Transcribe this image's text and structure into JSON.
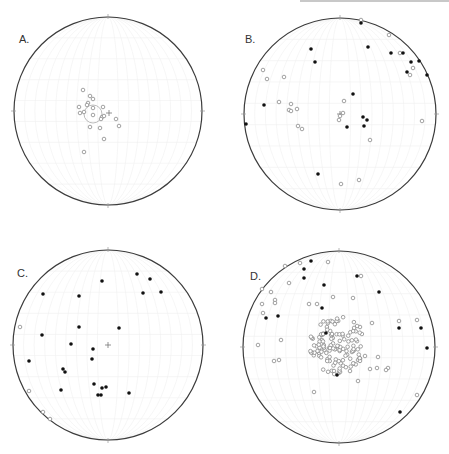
{
  "chart_data": [
    {
      "type": "scatter",
      "title": "A.",
      "subtype": "stereonet",
      "center": [
        108,
        111
      ],
      "radius": 94,
      "legend": [],
      "mean_marker": {
        "x": 93,
        "y": 114,
        "circle_radius": 9
      },
      "open_points": [
        [
          83,
          90
        ],
        [
          90,
          96
        ],
        [
          93,
          99
        ],
        [
          88,
          103
        ],
        [
          87,
          105
        ],
        [
          79,
          107
        ],
        [
          84,
          112
        ],
        [
          93,
          108
        ],
        [
          103,
          107
        ],
        [
          80,
          113
        ],
        [
          93,
          115
        ],
        [
          102,
          117
        ],
        [
          104,
          116
        ],
        [
          101,
          119
        ],
        [
          116,
          119
        ],
        [
          119,
          126
        ],
        [
          90,
          127
        ],
        [
          100,
          128
        ],
        [
          104,
          139
        ],
        [
          84,
          152
        ]
      ],
      "filled_points": [],
      "center_cross": [
        109,
        113
      ]
    },
    {
      "type": "scatter",
      "title": "B.",
      "subtype": "stereonet",
      "center": [
        340,
        114
      ],
      "radius": 96,
      "open_points": [
        [
          361,
          20
        ],
        [
          389,
          35
        ],
        [
          400,
          53
        ],
        [
          413,
          68
        ],
        [
          410,
          75
        ],
        [
          263,
          70
        ],
        [
          267,
          79
        ],
        [
          284,
          77
        ],
        [
          279,
          102
        ],
        [
          291,
          104
        ],
        [
          289,
          110
        ],
        [
          297,
          109
        ],
        [
          291,
          111
        ],
        [
          344,
          101
        ],
        [
          343,
          113
        ],
        [
          340,
          116
        ],
        [
          339,
          120
        ],
        [
          298,
          126
        ],
        [
          302,
          129
        ],
        [
          422,
          121
        ],
        [
          370,
          140
        ],
        [
          341,
          184
        ],
        [
          359,
          180
        ]
      ],
      "filled_points": [
        [
          361,
          23
        ],
        [
          311,
          49
        ],
        [
          315,
          62
        ],
        [
          368,
          47
        ],
        [
          391,
          53
        ],
        [
          403,
          53
        ],
        [
          411,
          62
        ],
        [
          419,
          61
        ],
        [
          407,
          72
        ],
        [
          427,
          75
        ],
        [
          264,
          105
        ],
        [
          246,
          124
        ],
        [
          353,
          94
        ],
        [
          363,
          117
        ],
        [
          367,
          120
        ],
        [
          364,
          126
        ],
        [
          347,
          127
        ],
        [
          318,
          174
        ]
      ],
      "center_cross": [
        340,
        114
      ]
    },
    {
      "type": "scatter",
      "title": "C.",
      "subtype": "stereonet",
      "center": [
        108,
        345
      ],
      "radius": 95,
      "open_points": [
        [
          20,
          327
        ],
        [
          29,
          391
        ],
        [
          43,
          412
        ],
        [
          50,
          419
        ]
      ],
      "filled_points": [
        [
          137,
          274
        ],
        [
          150,
          279
        ],
        [
          102,
          281
        ],
        [
          143,
          293
        ],
        [
          161,
          292
        ],
        [
          43,
          294
        ],
        [
          79,
          296
        ],
        [
          79,
          327
        ],
        [
          119,
          328
        ],
        [
          42,
          335
        ],
        [
          71,
          344
        ],
        [
          93,
          349
        ],
        [
          92,
          359
        ],
        [
          29,
          361
        ],
        [
          63,
          369
        ],
        [
          65,
          372
        ],
        [
          94,
          384
        ],
        [
          61,
          390
        ],
        [
          102,
          388
        ],
        [
          106,
          387
        ],
        [
          98,
          395
        ],
        [
          101,
          395
        ],
        [
          129,
          393
        ]
      ],
      "center_cross": [
        108,
        345
      ]
    },
    {
      "type": "scatter",
      "title": "D.",
      "subtype": "stereonet",
      "center": [
        339,
        347
      ],
      "radius": 96,
      "open_points_count_approx": 160,
      "filled_points": [
        [
          311,
          261
        ],
        [
          304,
          269
        ],
        [
          304,
          278
        ],
        [
          357,
          276
        ],
        [
          324,
          285
        ],
        [
          379,
          292
        ],
        [
          322,
          308
        ],
        [
          278,
          316
        ],
        [
          266,
          318
        ],
        [
          326,
          333
        ],
        [
          399,
          328
        ],
        [
          421,
          328
        ],
        [
          427,
          348
        ],
        [
          337,
          375
        ],
        [
          400,
          412
        ]
      ],
      "open_points_sparse": [
        [
          300,
          263
        ],
        [
          328,
          262
        ],
        [
          285,
          266
        ],
        [
          361,
          276
        ],
        [
          289,
          283
        ],
        [
          262,
          289
        ],
        [
          271,
          292
        ],
        [
          275,
          300
        ],
        [
          333,
          297
        ],
        [
          262,
          304
        ],
        [
          275,
          303
        ],
        [
          263,
          313
        ],
        [
          309,
          304
        ],
        [
          317,
          304
        ],
        [
          353,
          298
        ],
        [
          399,
          321
        ],
        [
          417,
          320
        ],
        [
          360,
          327
        ],
        [
          372,
          323
        ],
        [
          281,
          340
        ],
        [
          258,
          345
        ],
        [
          279,
          360
        ],
        [
          274,
          361
        ],
        [
          358,
          360
        ],
        [
          365,
          356
        ],
        [
          378,
          357
        ],
        [
          370,
          369
        ],
        [
          377,
          368
        ],
        [
          388,
          368
        ],
        [
          314,
          392
        ],
        [
          417,
          395
        ],
        [
          358,
          381
        ],
        [
          386,
          370
        ]
      ],
      "center_cross": [
        339,
        347
      ]
    }
  ],
  "panels": [
    {
      "label": "A."
    },
    {
      "label": "B."
    },
    {
      "label": "C."
    },
    {
      "label": "D."
    }
  ],
  "colors": {
    "circle": "#3c3c3c",
    "open_point": "#8a8a8a",
    "filled_point": "#111111",
    "grid": "#f0f0f0"
  }
}
